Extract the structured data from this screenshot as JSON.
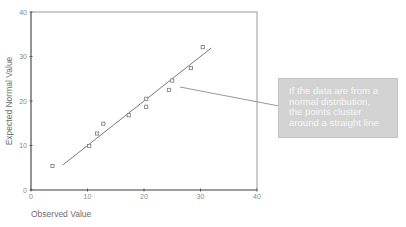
{
  "chart_data": {
    "type": "scatter",
    "title": "",
    "xlabel": "Observed Value",
    "ylabel": "Expected Normal Value",
    "xlim": [
      0,
      40
    ],
    "ylim": [
      0,
      40
    ],
    "xticks": [
      0,
      10,
      20,
      30,
      40
    ],
    "yticks": [
      0,
      10,
      20,
      30,
      40
    ],
    "grid": false,
    "points": [
      {
        "x": 3.8,
        "y": 5.4
      },
      {
        "x": 10.3,
        "y": 9.9
      },
      {
        "x": 11.7,
        "y": 12.7
      },
      {
        "x": 12.8,
        "y": 14.9
      },
      {
        "x": 17.3,
        "y": 16.8
      },
      {
        "x": 20.4,
        "y": 18.7
      },
      {
        "x": 20.4,
        "y": 20.5
      },
      {
        "x": 24.4,
        "y": 22.5
      },
      {
        "x": 25.0,
        "y": 24.6
      },
      {
        "x": 28.3,
        "y": 27.4
      },
      {
        "x": 30.4,
        "y": 32.1
      }
    ],
    "reference_line": {
      "x1": 5.6,
      "y1": 5.6,
      "x2": 31.9,
      "y2": 31.9
    },
    "annotation": {
      "lines": [
        "If the data are from a",
        "normal distribution,",
        "the points cluster",
        "around a straight line"
      ],
      "placement": "right",
      "fill": "#d3d3d3",
      "text_color": "#f7f7f7"
    }
  }
}
